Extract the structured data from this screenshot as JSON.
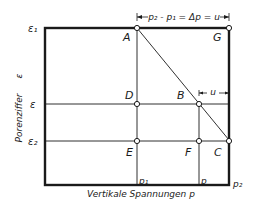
{
  "diagram": {
    "dimension_label": "p₂ - p₁ = Δp = u",
    "u_label": "u",
    "y_axis_label": "Porenziffer",
    "y_axis_symbol": "ε",
    "x_axis_label": "Vertikale Spannungen p",
    "y_ticks": {
      "e1": "ε₁",
      "e": "ε",
      "e2": "ε₂"
    },
    "x_ticks": {
      "p1": "p₁",
      "p": "p",
      "p2": "p₂"
    },
    "points": {
      "A": "A",
      "G": "G",
      "D": "D",
      "B": "B",
      "E": "E",
      "F": "F",
      "C": "C"
    },
    "line_color": "#1a1a1a",
    "background": "#ffffff"
  }
}
